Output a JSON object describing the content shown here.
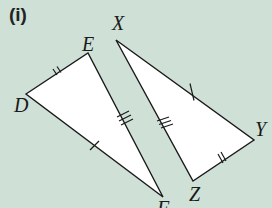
{
  "part_label": "(i)",
  "colors": {
    "background": "#cfe0d6",
    "fill": "#ffffff",
    "stroke": "#1a1a1a"
  },
  "triangle_def": {
    "vertices": {
      "D": {
        "label": "D",
        "x": 26,
        "y": 94
      },
      "E": {
        "label": "E",
        "x": 88,
        "y": 53
      },
      "F": {
        "label": "F",
        "x": 163,
        "y": 197
      }
    },
    "ticks": {
      "DE": 2,
      "EF": 3,
      "DF": 1
    }
  },
  "triangle_xyz": {
    "vertices": {
      "X": {
        "label": "X",
        "x": 116,
        "y": 40
      },
      "Y": {
        "label": "Y",
        "x": 254,
        "y": 140
      },
      "Z": {
        "label": "Z",
        "x": 193,
        "y": 181
      }
    },
    "ticks": {
      "XY": 1,
      "YZ": 2,
      "XZ": 3
    }
  }
}
